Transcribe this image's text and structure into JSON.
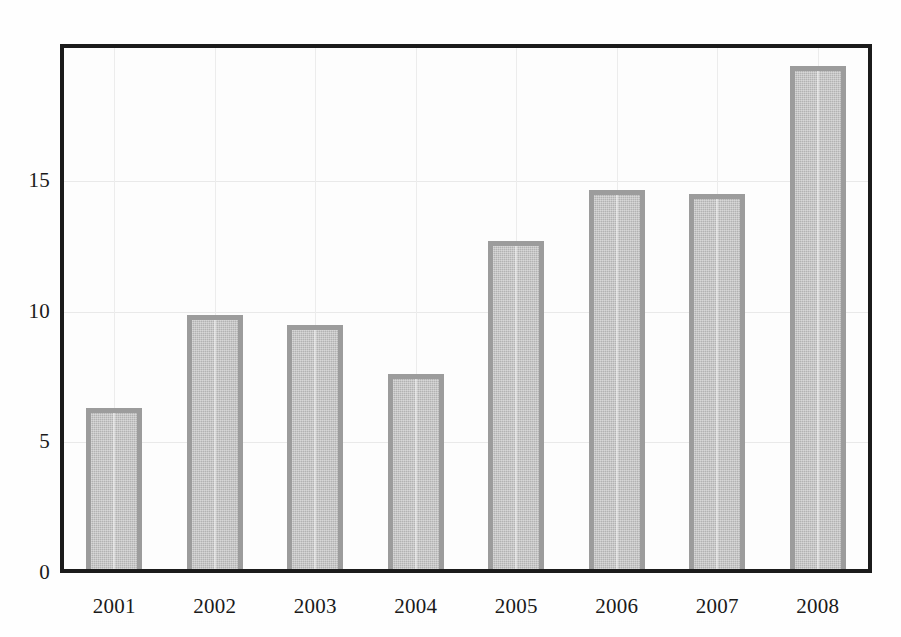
{
  "chart_data": {
    "type": "bar",
    "title": "",
    "subtitle": "",
    "xlabel": "",
    "ylabel": "",
    "categories": [
      "2001",
      "2002",
      "2003",
      "2004",
      "2005",
      "2006",
      "2007",
      "2008"
    ],
    "values": [
      6.3,
      9.85,
      9.5,
      7.6,
      12.7,
      14.65,
      14.5,
      19.4
    ],
    "ylim": [
      0,
      20.3
    ],
    "xlim": [
      0,
      8
    ],
    "y_ticks": [
      0,
      5,
      10,
      15
    ],
    "y_tick_labels": [
      "0",
      "5",
      "10",
      "15"
    ],
    "x_tick_labels": [
      "2001",
      "2002",
      "2003",
      "2004",
      "2005",
      "2006",
      "2007",
      "2008"
    ],
    "grid": true,
    "grid_axis": "both",
    "legend": false,
    "legend_position": "none",
    "series": [
      {
        "name": "",
        "values": [
          6.3,
          9.85,
          9.5,
          7.6,
          12.7,
          14.65,
          14.5,
          19.4
        ]
      }
    ],
    "annotations": []
  },
  "style": {
    "background_color": "#fefefe",
    "plot_background_color": "#fdfdfd",
    "frame_color": "#1b1b1b",
    "bar_fill_color": "#b2b2b2",
    "bar_edge_color": "#9c9c9c",
    "gridline_color": "#e9e9e9",
    "tick_label_color": "#1a1a1a"
  },
  "axes": {
    "y_labels": [
      {
        "text": "15",
        "value": 15
      },
      {
        "text": "10",
        "value": 10
      },
      {
        "text": "5",
        "value": 5
      },
      {
        "text": "0",
        "value": 0
      }
    ],
    "x_labels": [
      {
        "text": "2001"
      },
      {
        "text": "2002"
      },
      {
        "text": "2003"
      },
      {
        "text": "2004"
      },
      {
        "text": "2005"
      },
      {
        "text": "2006"
      },
      {
        "text": "2007"
      },
      {
        "text": "2008"
      }
    ]
  }
}
